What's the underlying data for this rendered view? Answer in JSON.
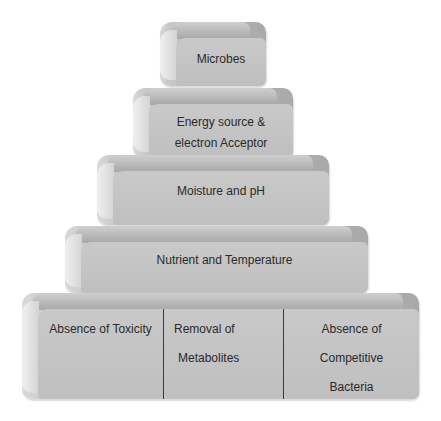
{
  "diagram": {
    "type": "pyramid",
    "tiers": [
      {
        "label": "Microbes"
      },
      {
        "label": "Energy source & electron Acceptor",
        "lines": [
          "Energy source &",
          "electron Acceptor"
        ]
      },
      {
        "label": "Moisture and pH"
      },
      {
        "label": "Nutrient and Temperature"
      },
      {
        "label": "Base",
        "cells": [
          {
            "lines": [
              "Absence of Toxicity"
            ]
          },
          {
            "lines": [
              "Removal of",
              "Metabolites"
            ]
          },
          {
            "lines": [
              "Absence of",
              "Competitive",
              "Bacteria"
            ]
          }
        ]
      }
    ],
    "colors": {
      "face": "#c4c4c4",
      "top": "#a8a8a8",
      "text": "#2a2a2a",
      "divider": "#3a3a3a"
    }
  }
}
